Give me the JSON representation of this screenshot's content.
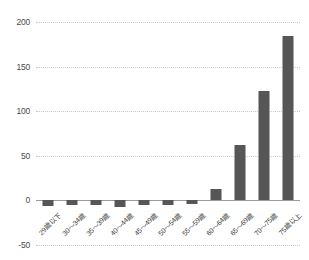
{
  "chart_data": {
    "type": "bar",
    "title": "",
    "subtitle": "",
    "xlabel": "",
    "ylabel": "",
    "ylim": [
      -50,
      200
    ],
    "ytick_values": [
      200,
      150,
      100,
      50,
      0,
      -50
    ],
    "ytick_labels": [
      "200",
      "150",
      "100",
      "50",
      "0",
      "-50"
    ],
    "grid": true,
    "legend": false,
    "bar_color": "#565656",
    "grid_color": "#c9c9c9",
    "axis_color": "#9a9a9a",
    "categories": [
      "29歳以下",
      "30〜34歳",
      "35〜39歳",
      "40〜44歳",
      "45〜49歳",
      "50〜54歳",
      "55〜59歳",
      "60〜64歳",
      "65〜69歳",
      "70〜75歳",
      "75歳以上"
    ],
    "values": [
      -7,
      -6,
      -6,
      -8,
      -6,
      -6,
      -5,
      12,
      62,
      122,
      184
    ]
  }
}
